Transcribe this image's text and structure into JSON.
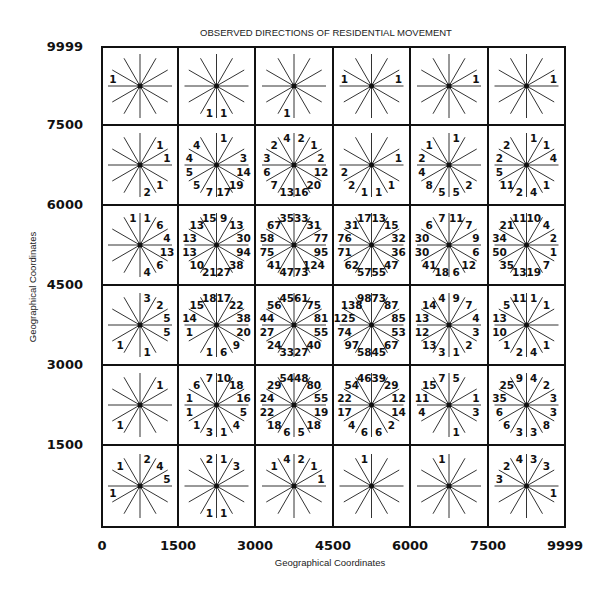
{
  "chart_data": {
    "type": "rose-grid",
    "title": "OBSERVED DIRECTIONS OF RESIDENTIAL  MOVEMENT",
    "xlabel": "Geographical  Coordinates",
    "ylabel": "Geographical  Coordinates",
    "x_ticks": [
      "0",
      "1500",
      "3000",
      "4500",
      "6000",
      "7500",
      "9999"
    ],
    "y_ticks": [
      "9999",
      "7500",
      "6000",
      "4500",
      "3000",
      "1500"
    ],
    "xlim": [
      0,
      9999
    ],
    "ylim": [
      0,
      9999
    ],
    "x_bins": [
      [
        0,
        1500
      ],
      [
        1500,
        3000
      ],
      [
        3000,
        4500
      ],
      [
        4500,
        6000
      ],
      [
        6000,
        7500
      ],
      [
        7500,
        9999
      ]
    ],
    "y_bins": [
      [
        7500,
        9999
      ],
      [
        6000,
        7500
      ],
      [
        4500,
        6000
      ],
      [
        3000,
        4500
      ],
      [
        1500,
        3000
      ],
      [
        0,
        1500
      ]
    ],
    "direction_sectors_deg": [
      75,
      45,
      15,
      -15,
      -45,
      -75,
      -105,
      -135,
      -165,
      165,
      135,
      105
    ],
    "direction_note": "Counts per 30-degree sector, angles measured counter-clockwise from east; null = no count shown",
    "rows": [
      [
        [
          null,
          null,
          null,
          null,
          null,
          null,
          null,
          null,
          null,
          1,
          null,
          null
        ],
        [
          null,
          null,
          null,
          null,
          null,
          1,
          1,
          null,
          null,
          null,
          null,
          null
        ],
        [
          null,
          null,
          null,
          null,
          null,
          null,
          1,
          null,
          null,
          null,
          null,
          null
        ],
        [
          null,
          null,
          1,
          null,
          null,
          null,
          null,
          null,
          null,
          1,
          null,
          null
        ],
        [
          null,
          null,
          1,
          null,
          null,
          null,
          null,
          null,
          null,
          null,
          null,
          null
        ],
        [
          null,
          null,
          1,
          null,
          null,
          null,
          null,
          null,
          null,
          null,
          null,
          null
        ]
      ],
      [
        [
          null,
          1,
          1,
          null,
          1,
          2,
          null,
          null,
          null,
          null,
          null,
          null
        ],
        [
          1,
          null,
          3,
          14,
          19,
          17,
          7,
          5,
          5,
          4,
          4,
          null
        ],
        [
          2,
          1,
          2,
          12,
          20,
          16,
          13,
          7,
          6,
          3,
          2,
          4
        ],
        [
          null,
          null,
          1,
          null,
          1,
          1,
          1,
          2,
          2,
          null,
          null,
          null
        ],
        [
          1,
          null,
          null,
          null,
          2,
          5,
          5,
          8,
          4,
          2,
          1,
          null
        ],
        [
          1,
          1,
          4,
          null,
          1,
          4,
          2,
          11,
          5,
          2,
          2,
          null
        ]
      ],
      [
        [
          1,
          6,
          4,
          13,
          6,
          4,
          null,
          null,
          null,
          null,
          null,
          1
        ],
        [
          9,
          13,
          30,
          94,
          38,
          27,
          21,
          10,
          13,
          13,
          13,
          15
        ],
        [
          33,
          31,
          77,
          95,
          124,
          73,
          47,
          41,
          75,
          58,
          67,
          35
        ],
        [
          13,
          15,
          32,
          36,
          47,
          55,
          57,
          62,
          71,
          76,
          31,
          17
        ],
        [
          11,
          7,
          9,
          6,
          12,
          6,
          18,
          41,
          30,
          30,
          6,
          7
        ],
        [
          10,
          4,
          2,
          1,
          7,
          19,
          13,
          35,
          50,
          34,
          21,
          11
        ]
      ],
      [
        [
          3,
          2,
          5,
          5,
          null,
          1,
          null,
          1,
          null,
          null,
          null,
          null
        ],
        [
          17,
          22,
          38,
          20,
          9,
          6,
          1,
          null,
          1,
          14,
          15,
          18
        ],
        [
          61,
          75,
          81,
          55,
          40,
          27,
          33,
          24,
          27,
          44,
          56,
          45
        ],
        [
          73,
          87,
          85,
          53,
          67,
          45,
          58,
          97,
          74,
          125,
          138,
          98
        ],
        [
          9,
          7,
          4,
          3,
          2,
          1,
          3,
          13,
          12,
          13,
          14,
          4
        ],
        [
          1,
          1,
          null,
          null,
          1,
          4,
          2,
          1,
          10,
          13,
          5,
          11
        ]
      ],
      [
        [
          null,
          1,
          null,
          null,
          null,
          null,
          null,
          1,
          null,
          null,
          null,
          null
        ],
        [
          10,
          18,
          16,
          5,
          4,
          1,
          3,
          1,
          1,
          1,
          6,
          7
        ],
        [
          48,
          80,
          55,
          19,
          18,
          5,
          6,
          18,
          22,
          24,
          29,
          54
        ],
        [
          39,
          29,
          12,
          14,
          2,
          6,
          6,
          4,
          17,
          22,
          54,
          46
        ],
        [
          5,
          null,
          1,
          3,
          null,
          1,
          null,
          null,
          4,
          11,
          15,
          7
        ],
        [
          4,
          2,
          3,
          3,
          8,
          3,
          3,
          6,
          6,
          35,
          25,
          9
        ]
      ],
      [
        [
          2,
          4,
          5,
          null,
          null,
          null,
          null,
          null,
          1,
          null,
          1,
          null
        ],
        [
          1,
          3,
          null,
          null,
          null,
          1,
          1,
          null,
          null,
          null,
          null,
          2
        ],
        [
          2,
          1,
          1,
          null,
          null,
          null,
          null,
          null,
          null,
          null,
          1,
          4
        ],
        [
          null,
          null,
          null,
          null,
          null,
          null,
          null,
          null,
          null,
          null,
          null,
          1
        ],
        [
          null,
          null,
          null,
          null,
          null,
          null,
          null,
          null,
          null,
          null,
          null,
          1
        ],
        [
          3,
          3,
          null,
          1,
          null,
          null,
          null,
          null,
          null,
          3,
          2,
          4
        ]
      ]
    ]
  }
}
